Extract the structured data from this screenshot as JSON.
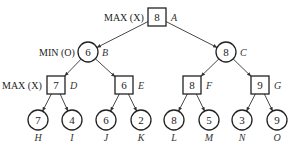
{
  "diagram": {
    "type": "minimax-game-tree",
    "levels": [
      {
        "role": "MAX (X)",
        "shape": "square"
      },
      {
        "role": "MIN (O)",
        "shape": "circle"
      },
      {
        "role": "MAX (X)",
        "shape": "square"
      },
      {
        "role": "",
        "shape": "circle"
      }
    ],
    "nodes": {
      "A": {
        "value": "8",
        "name": "A",
        "x": 157,
        "y": 17,
        "shape": "square"
      },
      "B": {
        "value": "6",
        "name": "B",
        "x": 88,
        "y": 52,
        "shape": "circle"
      },
      "C": {
        "value": "8",
        "name": "C",
        "x": 226,
        "y": 52,
        "shape": "circle"
      },
      "D": {
        "value": "7",
        "name": "D",
        "x": 56,
        "y": 85,
        "shape": "square"
      },
      "E": {
        "value": "6",
        "name": "E",
        "x": 124,
        "y": 85,
        "shape": "square"
      },
      "F": {
        "value": "8",
        "name": "F",
        "x": 192,
        "y": 85,
        "shape": "square"
      },
      "G": {
        "value": "9",
        "name": "G",
        "x": 260,
        "y": 85,
        "shape": "square"
      },
      "H": {
        "value": "7",
        "name": "H",
        "x": 38,
        "y": 120,
        "shape": "circle"
      },
      "I": {
        "value": "4",
        "name": "I",
        "x": 72,
        "y": 120,
        "shape": "circle"
      },
      "J": {
        "value": "6",
        "name": "J",
        "x": 106,
        "y": 120,
        "shape": "circle"
      },
      "K": {
        "value": "2",
        "name": "K",
        "x": 141,
        "y": 120,
        "shape": "circle"
      },
      "L": {
        "value": "8",
        "name": "L",
        "x": 174,
        "y": 120,
        "shape": "circle"
      },
      "M": {
        "value": "5",
        "name": "M",
        "x": 209,
        "y": 120,
        "shape": "circle"
      },
      "N": {
        "value": "3",
        "name": "N",
        "x": 242,
        "y": 120,
        "shape": "circle"
      },
      "O": {
        "value": "9",
        "name": "O",
        "x": 277,
        "y": 120,
        "shape": "circle"
      }
    },
    "edges": [
      [
        "A",
        "B"
      ],
      [
        "A",
        "C"
      ],
      [
        "B",
        "D"
      ],
      [
        "B",
        "E"
      ],
      [
        "C",
        "F"
      ],
      [
        "C",
        "G"
      ],
      [
        "D",
        "H"
      ],
      [
        "D",
        "I"
      ],
      [
        "E",
        "J"
      ],
      [
        "E",
        "K"
      ],
      [
        "F",
        "L"
      ],
      [
        "F",
        "M"
      ],
      [
        "G",
        "N"
      ],
      [
        "G",
        "O"
      ]
    ],
    "role_labels": {
      "root": "MAX (X)",
      "level1": "MIN (O)",
      "level2": "MAX (X)"
    }
  }
}
